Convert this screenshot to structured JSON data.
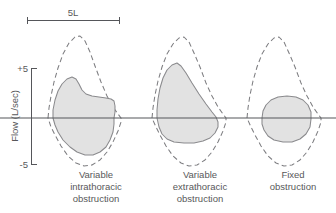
{
  "figure": {
    "background": "#ffffff",
    "width": 336,
    "height": 213
  },
  "scale_bar": {
    "label": "5L",
    "x_start": 27,
    "x_end": 119,
    "y": 20,
    "cap_height": 7
  },
  "y_axis": {
    "title": "Flow (L/sec)",
    "top_tick_label": "+5",
    "bottom_tick_label": "-5",
    "axis_x": 31,
    "top_y": 68,
    "bottom_y": 164,
    "zero_y": 118,
    "tick_len": 6
  },
  "baseline": {
    "y": 118,
    "x_start": 0,
    "x_end": 336,
    "color": "#55565a"
  },
  "colors": {
    "ink": "#58585a",
    "curve_stroke": "#8a8a8d",
    "normal_stroke": "#7d7d80",
    "fill": "#e2e2e2",
    "background": "#ffffff"
  },
  "panels": [
    {
      "id": "variable-intrathoracic",
      "label_lines": [
        "Variable",
        "intrathoracic",
        "obstruction"
      ],
      "label_center_x": 96,
      "label_top_y": 178,
      "normal_loop_path": "M 48 118 L 49 108 L 51 96 L 54 82 L 58 68 L 63 54 L 69 43 L 75 37 L 80 36 L 85 41 L 90 52 L 95 66 L 101 82 L 107 96 L 113 107 L 118 114 L 121 118 L 121 122 L 118 131 L 113 142 L 107 152 L 100 160 L 92 165 L 84 166 L 76 163 L 68 156 L 61 146 L 55 135 L 51 127 L 48 118 Z",
      "abnormal_loop_path": "M 53 118 L 53 110 L 55 100 L 58 91 L 62 84 L 67 79 L 72 77 L 76 79 L 79 84 L 82 90 L 86 94 L 92 96 L 99 97 L 106 98 L 111 99 L 114 101 L 115 106 L 115 112 L 114 118 L 114 124 L 113 132 L 110 140 L 106 147 L 100 152 L 93 155 L 85 155 L 77 152 L 70 147 L 63 140 L 58 132 L 55 125 L 53 118 Z",
      "description": "Expiratory limb plateau; inspiratory limb preserved"
    },
    {
      "id": "variable-extrathoracic",
      "label_lines": [
        "Variable",
        "extrathoracic",
        "obstruction"
      ],
      "label_center_x": 200,
      "label_top_y": 178,
      "normal_loop_path": "M 152 118 L 153 108 L 155 95 L 158 81 L 162 67 L 167 54 L 173 44 L 179 38 L 184 37 L 189 42 L 194 53 L 200 67 L 206 83 L 212 96 L 218 107 L 223 114 L 226 118 L 226 122 L 223 131 L 218 142 L 212 152 L 205 160 L 197 165 L 189 166 L 181 163 L 173 156 L 166 146 L 160 135 L 156 127 L 152 118 Z",
      "abnormal_loop_path": "M 157 118 L 157 110 L 158 99 L 160 88 L 163 78 L 167 70 L 172 65 L 177 63 L 181 66 L 186 73 L 192 83 L 199 94 L 206 104 L 212 112 L 216 117 L 218 122 L 218 127 L 215 133 L 210 138 L 203 141 L 194 143 L 184 143 L 174 142 L 167 139 L 162 134 L 159 127 L 157 118 Z",
      "description": "Inspiratory limb plateau; expiratory limb preserved"
    },
    {
      "id": "fixed",
      "label_lines": [
        "Fixed",
        "obstruction"
      ],
      "label_center_x": 293,
      "label_top_y": 178,
      "normal_loop_path": "M 247 118 L 248 108 L 250 95 L 253 81 L 257 67 L 262 54 L 268 44 L 274 38 L 279 37 L 284 42 L 289 53 L 295 67 L 301 83 L 307 96 L 313 107 L 318 114 L 321 118 L 321 122 L 318 131 L 313 142 L 307 152 L 300 160 L 292 165 L 284 166 L 276 163 L 268 156 L 261 146 L 255 135 L 251 127 L 247 118 Z",
      "abnormal_loop_path": "M 262 118 L 263 111 L 266 105 L 271 100 L 278 97 L 287 96 L 296 97 L 303 100 L 308 105 L 311 112 L 311 119 L 310 127 L 306 134 L 300 139 L 292 142 L 283 142 L 274 140 L 268 136 L 264 130 L 262 124 L 262 118 Z",
      "description": "Both inspiratory and expiratory limbs plateau"
    }
  ]
}
